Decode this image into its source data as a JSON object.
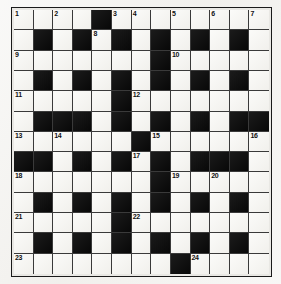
{
  "puzzle": {
    "title": "",
    "type": "crossword-grid",
    "columns": 13,
    "rows": 13,
    "colors": {
      "page_background": "#f2f1ee",
      "grid_border": "#1a1a1a",
      "white_cell": "#f6f5f2",
      "black_cell": "#121212",
      "cell_rule": "#3a3a3a",
      "number_text": "#111111"
    },
    "legend": {
      "white_cell_label": "open square",
      "black_cell_label": "blocked square"
    },
    "clue_numbers": [
      1,
      2,
      3,
      4,
      5,
      6,
      7,
      8,
      9,
      10,
      11,
      12,
      13,
      14,
      15,
      16,
      17,
      18,
      19,
      20,
      21,
      22,
      23,
      24
    ],
    "rows_data": [
      {
        "index": 1,
        "cells": [
          {
            "type": "white",
            "number": "1"
          },
          {
            "type": "white",
            "number": ""
          },
          {
            "type": "white",
            "number": "2"
          },
          {
            "type": "white",
            "number": ""
          },
          {
            "type": "black",
            "number": ""
          },
          {
            "type": "white",
            "number": "3"
          },
          {
            "type": "white",
            "number": "4"
          },
          {
            "type": "white",
            "number": ""
          },
          {
            "type": "white",
            "number": "5"
          },
          {
            "type": "white",
            "number": ""
          },
          {
            "type": "white",
            "number": "6"
          },
          {
            "type": "white",
            "number": ""
          },
          {
            "type": "white",
            "number": "7"
          }
        ]
      },
      {
        "index": 2,
        "cells": [
          {
            "type": "white",
            "number": ""
          },
          {
            "type": "black",
            "number": ""
          },
          {
            "type": "white",
            "number": ""
          },
          {
            "type": "black",
            "number": ""
          },
          {
            "type": "white",
            "number": "8"
          },
          {
            "type": "black",
            "number": ""
          },
          {
            "type": "white",
            "number": ""
          },
          {
            "type": "black",
            "number": ""
          },
          {
            "type": "white",
            "number": ""
          },
          {
            "type": "black",
            "number": ""
          },
          {
            "type": "white",
            "number": ""
          },
          {
            "type": "black",
            "number": ""
          },
          {
            "type": "white",
            "number": ""
          }
        ]
      },
      {
        "index": 3,
        "cells": [
          {
            "type": "white",
            "number": "9"
          },
          {
            "type": "white",
            "number": ""
          },
          {
            "type": "white",
            "number": ""
          },
          {
            "type": "white",
            "number": ""
          },
          {
            "type": "white",
            "number": ""
          },
          {
            "type": "white",
            "number": ""
          },
          {
            "type": "white",
            "number": ""
          },
          {
            "type": "black",
            "number": ""
          },
          {
            "type": "white",
            "number": "10"
          },
          {
            "type": "white",
            "number": ""
          },
          {
            "type": "white",
            "number": ""
          },
          {
            "type": "white",
            "number": ""
          },
          {
            "type": "white",
            "number": ""
          }
        ]
      },
      {
        "index": 4,
        "cells": [
          {
            "type": "white",
            "number": ""
          },
          {
            "type": "black",
            "number": ""
          },
          {
            "type": "white",
            "number": ""
          },
          {
            "type": "black",
            "number": ""
          },
          {
            "type": "white",
            "number": ""
          },
          {
            "type": "black",
            "number": ""
          },
          {
            "type": "white",
            "number": ""
          },
          {
            "type": "black",
            "number": ""
          },
          {
            "type": "white",
            "number": ""
          },
          {
            "type": "black",
            "number": ""
          },
          {
            "type": "white",
            "number": ""
          },
          {
            "type": "black",
            "number": ""
          },
          {
            "type": "white",
            "number": ""
          }
        ]
      },
      {
        "index": 5,
        "cells": [
          {
            "type": "white",
            "number": "11"
          },
          {
            "type": "white",
            "number": ""
          },
          {
            "type": "white",
            "number": ""
          },
          {
            "type": "white",
            "number": ""
          },
          {
            "type": "white",
            "number": ""
          },
          {
            "type": "black",
            "number": ""
          },
          {
            "type": "white",
            "number": "12"
          },
          {
            "type": "white",
            "number": ""
          },
          {
            "type": "white",
            "number": ""
          },
          {
            "type": "white",
            "number": ""
          },
          {
            "type": "white",
            "number": ""
          },
          {
            "type": "white",
            "number": ""
          },
          {
            "type": "white",
            "number": ""
          }
        ]
      },
      {
        "index": 6,
        "cells": [
          {
            "type": "white",
            "number": ""
          },
          {
            "type": "black",
            "number": ""
          },
          {
            "type": "black",
            "number": ""
          },
          {
            "type": "black",
            "number": ""
          },
          {
            "type": "white",
            "number": ""
          },
          {
            "type": "black",
            "number": ""
          },
          {
            "type": "white",
            "number": ""
          },
          {
            "type": "black",
            "number": ""
          },
          {
            "type": "white",
            "number": ""
          },
          {
            "type": "black",
            "number": ""
          },
          {
            "type": "white",
            "number": ""
          },
          {
            "type": "black",
            "number": ""
          },
          {
            "type": "black",
            "number": ""
          }
        ]
      },
      {
        "index": 7,
        "cells": [
          {
            "type": "white",
            "number": "13"
          },
          {
            "type": "white",
            "number": ""
          },
          {
            "type": "white",
            "number": "14"
          },
          {
            "type": "white",
            "number": ""
          },
          {
            "type": "white",
            "number": ""
          },
          {
            "type": "white",
            "number": ""
          },
          {
            "type": "black",
            "number": ""
          },
          {
            "type": "white",
            "number": "15"
          },
          {
            "type": "white",
            "number": ""
          },
          {
            "type": "white",
            "number": ""
          },
          {
            "type": "white",
            "number": ""
          },
          {
            "type": "white",
            "number": ""
          },
          {
            "type": "white",
            "number": "16"
          }
        ]
      },
      {
        "index": 8,
        "cells": [
          {
            "type": "black",
            "number": ""
          },
          {
            "type": "black",
            "number": ""
          },
          {
            "type": "white",
            "number": ""
          },
          {
            "type": "black",
            "number": ""
          },
          {
            "type": "white",
            "number": ""
          },
          {
            "type": "black",
            "number": ""
          },
          {
            "type": "white",
            "number": "17"
          },
          {
            "type": "black",
            "number": ""
          },
          {
            "type": "white",
            "number": ""
          },
          {
            "type": "black",
            "number": ""
          },
          {
            "type": "black",
            "number": ""
          },
          {
            "type": "black",
            "number": ""
          },
          {
            "type": "white",
            "number": ""
          }
        ]
      },
      {
        "index": 9,
        "cells": [
          {
            "type": "white",
            "number": "18"
          },
          {
            "type": "white",
            "number": ""
          },
          {
            "type": "white",
            "number": ""
          },
          {
            "type": "white",
            "number": ""
          },
          {
            "type": "white",
            "number": ""
          },
          {
            "type": "white",
            "number": ""
          },
          {
            "type": "white",
            "number": ""
          },
          {
            "type": "black",
            "number": ""
          },
          {
            "type": "white",
            "number": "19"
          },
          {
            "type": "white",
            "number": ""
          },
          {
            "type": "white",
            "number": "20"
          },
          {
            "type": "white",
            "number": ""
          },
          {
            "type": "white",
            "number": ""
          }
        ]
      },
      {
        "index": 10,
        "cells": [
          {
            "type": "white",
            "number": ""
          },
          {
            "type": "black",
            "number": ""
          },
          {
            "type": "white",
            "number": ""
          },
          {
            "type": "black",
            "number": ""
          },
          {
            "type": "white",
            "number": ""
          },
          {
            "type": "black",
            "number": ""
          },
          {
            "type": "white",
            "number": ""
          },
          {
            "type": "black",
            "number": ""
          },
          {
            "type": "white",
            "number": ""
          },
          {
            "type": "black",
            "number": ""
          },
          {
            "type": "white",
            "number": ""
          },
          {
            "type": "black",
            "number": ""
          },
          {
            "type": "white",
            "number": ""
          }
        ]
      },
      {
        "index": 11,
        "cells": [
          {
            "type": "white",
            "number": "21"
          },
          {
            "type": "white",
            "number": ""
          },
          {
            "type": "white",
            "number": ""
          },
          {
            "type": "white",
            "number": ""
          },
          {
            "type": "white",
            "number": ""
          },
          {
            "type": "black",
            "number": ""
          },
          {
            "type": "white",
            "number": "22"
          },
          {
            "type": "white",
            "number": ""
          },
          {
            "type": "white",
            "number": ""
          },
          {
            "type": "white",
            "number": ""
          },
          {
            "type": "white",
            "number": ""
          },
          {
            "type": "white",
            "number": ""
          },
          {
            "type": "white",
            "number": ""
          }
        ]
      },
      {
        "index": 12,
        "cells": [
          {
            "type": "white",
            "number": ""
          },
          {
            "type": "black",
            "number": ""
          },
          {
            "type": "white",
            "number": ""
          },
          {
            "type": "black",
            "number": ""
          },
          {
            "type": "white",
            "number": ""
          },
          {
            "type": "black",
            "number": ""
          },
          {
            "type": "white",
            "number": ""
          },
          {
            "type": "black",
            "number": ""
          },
          {
            "type": "white",
            "number": ""
          },
          {
            "type": "black",
            "number": ""
          },
          {
            "type": "white",
            "number": ""
          },
          {
            "type": "black",
            "number": ""
          },
          {
            "type": "white",
            "number": ""
          }
        ]
      },
      {
        "index": 13,
        "cells": [
          {
            "type": "white",
            "number": "23"
          },
          {
            "type": "white",
            "number": ""
          },
          {
            "type": "white",
            "number": ""
          },
          {
            "type": "white",
            "number": ""
          },
          {
            "type": "white",
            "number": ""
          },
          {
            "type": "white",
            "number": ""
          },
          {
            "type": "white",
            "number": ""
          },
          {
            "type": "white",
            "number": ""
          },
          {
            "type": "black",
            "number": ""
          },
          {
            "type": "white",
            "number": "24"
          },
          {
            "type": "white",
            "number": ""
          },
          {
            "type": "white",
            "number": ""
          },
          {
            "type": "white",
            "number": ""
          }
        ]
      }
    ]
  }
}
